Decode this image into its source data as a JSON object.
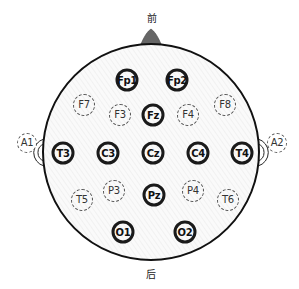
{
  "diagram": {
    "title_front": "前",
    "title_back": "后",
    "head": {
      "cx": 151,
      "cy": 152,
      "r": 108,
      "stroke": "#111111"
    },
    "nose": {
      "fill": "#666666"
    },
    "electrodes": [
      {
        "id": "Fp1",
        "label": "Fp1",
        "x": 127,
        "y": 80,
        "type": "primary"
      },
      {
        "id": "Fp2",
        "label": "Fp2",
        "x": 177,
        "y": 80,
        "type": "primary"
      },
      {
        "id": "F7",
        "label": "F7",
        "x": 84,
        "y": 105,
        "type": "secondary"
      },
      {
        "id": "F3",
        "label": "F3",
        "x": 120,
        "y": 115,
        "type": "secondary"
      },
      {
        "id": "Fz",
        "label": "Fz",
        "x": 153,
        "y": 115,
        "type": "primary"
      },
      {
        "id": "F4",
        "label": "F4",
        "x": 188,
        "y": 115,
        "type": "secondary"
      },
      {
        "id": "F8",
        "label": "F8",
        "x": 225,
        "y": 105,
        "type": "secondary"
      },
      {
        "id": "T3",
        "label": "T3",
        "x": 63,
        "y": 153,
        "type": "primary"
      },
      {
        "id": "C3",
        "label": "C3",
        "x": 108,
        "y": 153,
        "type": "primary"
      },
      {
        "id": "Cz",
        "label": "Cz",
        "x": 153,
        "y": 153,
        "type": "primary"
      },
      {
        "id": "C4",
        "label": "C4",
        "x": 198,
        "y": 153,
        "type": "primary"
      },
      {
        "id": "T4",
        "label": "T4",
        "x": 242,
        "y": 153,
        "type": "primary"
      },
      {
        "id": "T5",
        "label": "T5",
        "x": 82,
        "y": 200,
        "type": "secondary"
      },
      {
        "id": "P3",
        "label": "P3",
        "x": 114,
        "y": 191,
        "type": "secondary"
      },
      {
        "id": "Pz",
        "label": "Pz",
        "x": 154,
        "y": 195,
        "type": "primary"
      },
      {
        "id": "P4",
        "label": "P4",
        "x": 193,
        "y": 191,
        "type": "secondary"
      },
      {
        "id": "T6",
        "label": "T6",
        "x": 228,
        "y": 200,
        "type": "secondary"
      },
      {
        "id": "O1",
        "label": "O1",
        "x": 123,
        "y": 232,
        "type": "primary"
      },
      {
        "id": "O2",
        "label": "O2",
        "x": 185,
        "y": 232,
        "type": "primary"
      },
      {
        "id": "A1",
        "label": "A1",
        "x": 27,
        "y": 143,
        "type": "secondary"
      },
      {
        "id": "A2",
        "label": "A2",
        "x": 277,
        "y": 143,
        "type": "secondary"
      }
    ]
  }
}
